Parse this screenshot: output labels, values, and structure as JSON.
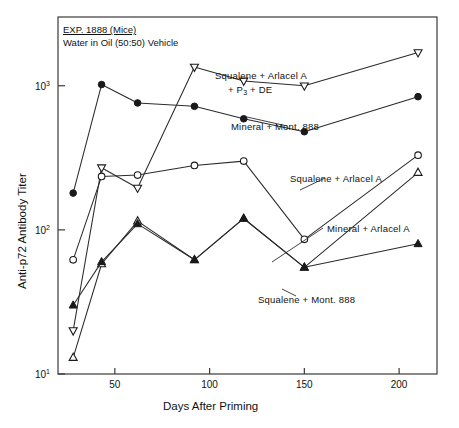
{
  "figure": {
    "title_line1": "EXP. 1888 (Mice)",
    "title_line2": "Water in Oil (50:50) Vehicle",
    "xlabel": "Days After Priming",
    "ylabel": "Anti-p72 Antibody Titer"
  },
  "annotations": {
    "squalene_arlacel_p3_de_line1": "Squalene + Arlacel A",
    "squalene_arlacel_p3_de_line2a": "+ P",
    "squalene_arlacel_p3_de_line2b": "3",
    "squalene_arlacel_p3_de_line2c": " + DE",
    "mineral_mont888": "Mineral + Mont. 888",
    "squalene_arlacel": "Squalene + Arlacel A",
    "mineral_arlacel": "Mineral + Arlacel A",
    "squalene_mont888": "Squalene + Mont. 888"
  },
  "axis": {
    "x_ticks": [
      "50",
      "100",
      "150",
      "200"
    ],
    "x_tick_values": [
      50,
      100,
      150,
      200
    ],
    "y_ticks": [
      "10",
      "10",
      "10"
    ],
    "y_tick_exponents": [
      "3",
      "2",
      "1"
    ],
    "y_tick_values": [
      1000,
      100,
      10
    ]
  },
  "chart_data": {
    "type": "line",
    "xlabel": "Days After Priming",
    "ylabel": "Anti-p72 Antibody Titer",
    "xlim": [
      20,
      220
    ],
    "ylim": [
      10,
      3000
    ],
    "yscale": "log",
    "grid": false,
    "legend": "inline-annotations",
    "series": [
      {
        "name": "Squalene + Arlacel A + P3 + DE",
        "marker": "open-triangle-down",
        "x": [
          28,
          43,
          62,
          92,
          118,
          150,
          210
        ],
        "y": [
          20,
          270,
          195,
          1350,
          1080,
          1000,
          1700
        ]
      },
      {
        "name": "Mineral + Mont. 888",
        "marker": "filled-circle",
        "x": [
          28,
          43,
          62,
          92,
          118,
          150,
          210
        ],
        "y": [
          180,
          1020,
          760,
          720,
          590,
          480,
          840
        ]
      },
      {
        "name": "Squalene + Arlacel A",
        "marker": "open-circle",
        "x": [
          28,
          43,
          62,
          92,
          118,
          150,
          210
        ],
        "y": [
          62,
          235,
          240,
          280,
          300,
          86,
          330
        ]
      },
      {
        "name": "Mineral + Arlacel A",
        "marker": "open-triangle-up",
        "x": [
          28,
          43,
          62,
          92,
          118,
          150,
          210
        ],
        "y": [
          13,
          58,
          115,
          62,
          120,
          55,
          250
        ]
      },
      {
        "name": "Squalene + Mont. 888",
        "marker": "filled-triangle-up",
        "x": [
          28,
          43,
          62,
          92,
          118,
          150,
          210
        ],
        "y": [
          30,
          60,
          110,
          62,
          120,
          55,
          80
        ]
      }
    ]
  }
}
